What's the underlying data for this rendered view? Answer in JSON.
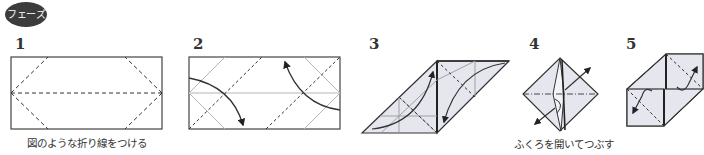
{
  "header": {
    "badge_label": "フェーズ"
  },
  "steps": [
    {
      "number": "1",
      "caption": "図のような折り線をつける"
    },
    {
      "number": "2",
      "caption": ""
    },
    {
      "number": "3",
      "caption": ""
    },
    {
      "number": "4",
      "caption": "ふくろを開いてつぶす"
    },
    {
      "number": "5",
      "caption": ""
    }
  ],
  "colors": {
    "badge_bg": "#3c3c3c",
    "line": "#333333",
    "crease_light": "#b5b5b5",
    "paper_fill": "#e6e6ef"
  }
}
